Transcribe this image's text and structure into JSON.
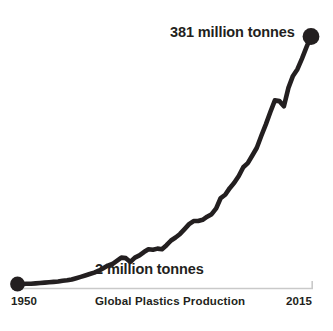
{
  "chart_data": {
    "type": "line",
    "title": "Global Plastics Production",
    "xlabel": "",
    "ylabel": "",
    "units": "million tonnes",
    "grid": false,
    "legend": null,
    "xlim": [
      1950,
      2015
    ],
    "ylim": [
      0,
      381
    ],
    "axis_tick_labels": [
      "1950",
      "2015"
    ],
    "annotations": [
      {
        "name": "start-value",
        "text": "2 million tonnes",
        "x": 1950,
        "y": 2
      },
      {
        "name": "end-value",
        "text": "381 million tonnes",
        "x": 2015,
        "y": 381
      }
    ],
    "endpoint_markers": [
      {
        "name": "start-point",
        "x": 1950,
        "y": 2
      },
      {
        "name": "end-point",
        "x": 2015,
        "y": 381
      }
    ],
    "x": [
      1950,
      1951,
      1952,
      1953,
      1954,
      1955,
      1956,
      1957,
      1958,
      1959,
      1960,
      1961,
      1962,
      1963,
      1964,
      1965,
      1966,
      1967,
      1968,
      1969,
      1970,
      1971,
      1972,
      1973,
      1974,
      1975,
      1976,
      1977,
      1978,
      1979,
      1980,
      1981,
      1982,
      1983,
      1984,
      1985,
      1986,
      1987,
      1988,
      1989,
      1990,
      1991,
      1992,
      1993,
      1994,
      1995,
      1996,
      1997,
      1998,
      1999,
      2000,
      2001,
      2002,
      2003,
      2004,
      2005,
      2006,
      2007,
      2008,
      2009,
      2010,
      2011,
      2012,
      2013,
      2014,
      2015
    ],
    "values": [
      2,
      2,
      3,
      3,
      4,
      5,
      6,
      7,
      8,
      9,
      11,
      12,
      14,
      17,
      20,
      23,
      26,
      29,
      33,
      38,
      43,
      46,
      52,
      58,
      57,
      50,
      58,
      62,
      68,
      73,
      72,
      74,
      73,
      80,
      88,
      93,
      99,
      107,
      115,
      120,
      120,
      122,
      127,
      131,
      140,
      156,
      161,
      171,
      179,
      189,
      202,
      208,
      219,
      230,
      247,
      263,
      280,
      296,
      295,
      288,
      313,
      329,
      338,
      352,
      367,
      381
    ],
    "series_color": "#231f20",
    "axis_color": "#c9c9c9",
    "background_color": "#ffffff"
  },
  "figure": {
    "caption": "Global Plastics Production",
    "axis_start_label": "1950",
    "axis_end_label": "2015",
    "end_value_label": "381 million tonnes",
    "start_value_label": "2 million tonnes"
  }
}
